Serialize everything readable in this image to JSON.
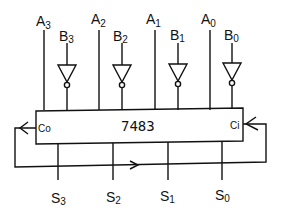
{
  "diagram": {
    "chip_label": "7483",
    "carry_out_label": "Co",
    "carry_in_label": "Ci",
    "inputs_a": [
      {
        "base": "A",
        "sub": "3"
      },
      {
        "base": "A",
        "sub": "2"
      },
      {
        "base": "A",
        "sub": "1"
      },
      {
        "base": "A",
        "sub": "0"
      }
    ],
    "inputs_b": [
      {
        "base": "B",
        "sub": "3"
      },
      {
        "base": "B",
        "sub": "2"
      },
      {
        "base": "B",
        "sub": "1"
      },
      {
        "base": "B",
        "sub": "0"
      }
    ],
    "outputs": [
      {
        "base": "S",
        "sub": "3"
      },
      {
        "base": "S",
        "sub": "2"
      },
      {
        "base": "S",
        "sub": "1"
      },
      {
        "base": "S",
        "sub": "0"
      }
    ],
    "line_color": "#111111"
  }
}
